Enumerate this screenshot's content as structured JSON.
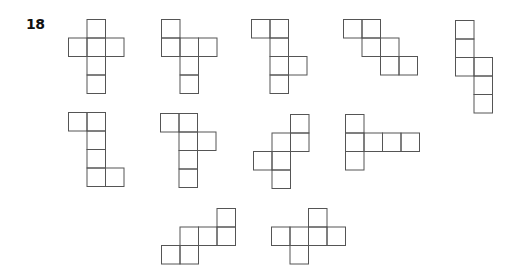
{
  "question": {
    "number": "18"
  },
  "style": {
    "stroke_color": "#555555",
    "background": "#ffffff",
    "cell_size": 18.5
  },
  "nets": [
    {
      "id": "net-1",
      "origin": [
        68,
        19
      ],
      "cells": [
        [
          1,
          0
        ],
        [
          0,
          1
        ],
        [
          1,
          1
        ],
        [
          2,
          1
        ],
        [
          1,
          2
        ],
        [
          1,
          3
        ]
      ]
    },
    {
      "id": "net-2",
      "origin": [
        161,
        19
      ],
      "cells": [
        [
          0,
          0
        ],
        [
          0,
          1
        ],
        [
          1,
          1
        ],
        [
          2,
          1
        ],
        [
          1,
          2
        ],
        [
          1,
          3
        ]
      ]
    },
    {
      "id": "net-3",
      "origin": [
        251,
        19
      ],
      "cells": [
        [
          0,
          0
        ],
        [
          1,
          0
        ],
        [
          1,
          1
        ],
        [
          1,
          2
        ],
        [
          2,
          2
        ],
        [
          1,
          3
        ]
      ]
    },
    {
      "id": "net-4",
      "origin": [
        343,
        19
      ],
      "cells": [
        [
          0,
          0
        ],
        [
          1,
          0
        ],
        [
          1,
          1
        ],
        [
          2,
          1
        ],
        [
          2,
          2
        ],
        [
          3,
          2
        ]
      ]
    },
    {
      "id": "net-5",
      "origin": [
        455,
        20
      ],
      "cells": [
        [
          0,
          0
        ],
        [
          0,
          1
        ],
        [
          0,
          2
        ],
        [
          1,
          2
        ],
        [
          1,
          3
        ],
        [
          1,
          4
        ]
      ]
    },
    {
      "id": "net-6",
      "origin": [
        68,
        112
      ],
      "cells": [
        [
          0,
          0
        ],
        [
          1,
          0
        ],
        [
          1,
          1
        ],
        [
          1,
          2
        ],
        [
          1,
          3
        ],
        [
          2,
          3
        ]
      ]
    },
    {
      "id": "net-7",
      "origin": [
        160,
        113
      ],
      "cells": [
        [
          0,
          0
        ],
        [
          1,
          0
        ],
        [
          1,
          1
        ],
        [
          2,
          1
        ],
        [
          1,
          2
        ],
        [
          1,
          3
        ]
      ]
    },
    {
      "id": "net-8",
      "origin": [
        253,
        114
      ],
      "cells": [
        [
          2,
          0
        ],
        [
          1,
          1
        ],
        [
          2,
          1
        ],
        [
          0,
          2
        ],
        [
          1,
          2
        ],
        [
          1,
          3
        ]
      ]
    },
    {
      "id": "net-9",
      "origin": [
        345,
        114
      ],
      "cells": [
        [
          0,
          0
        ],
        [
          0,
          1
        ],
        [
          1,
          1
        ],
        [
          2,
          1
        ],
        [
          3,
          1
        ],
        [
          0,
          2
        ]
      ]
    },
    {
      "id": "net-10",
      "origin": [
        161,
        208
      ],
      "cells": [
        [
          3,
          0
        ],
        [
          1,
          1
        ],
        [
          2,
          1
        ],
        [
          3,
          1
        ],
        [
          0,
          2
        ],
        [
          1,
          2
        ]
      ]
    },
    {
      "id": "net-11",
      "origin": [
        271,
        208
      ],
      "cells": [
        [
          2,
          0
        ],
        [
          0,
          1
        ],
        [
          1,
          1
        ],
        [
          2,
          1
        ],
        [
          3,
          1
        ],
        [
          1,
          2
        ]
      ]
    }
  ]
}
